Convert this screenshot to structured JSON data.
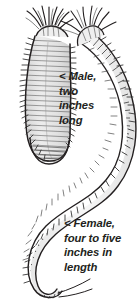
{
  "figure": {
    "background_color": "#ffffff",
    "ink_color": "#231f20",
    "shading_color": "#9a9a9a",
    "annotations": [
      {
        "id": "male",
        "marker": "<",
        "text": "< Male,\ntwo\ninches\nlong",
        "lines": [
          "< Male,",
          "two",
          "inches",
          "long"
        ],
        "points_to": "left worm"
      },
      {
        "id": "female",
        "marker": "<",
        "text": "< Female,\nfour to five\ninches in\nlength",
        "lines": [
          "< Female,",
          "four to five",
          "inches in",
          "length"
        ],
        "points_to": "right worm"
      }
    ],
    "specimens": [
      {
        "name": "male-worm",
        "label": "Male, two inches long",
        "sex": "male",
        "length": "two inches",
        "position": "upper left, J-shaped curve"
      },
      {
        "name": "female-worm",
        "label": "Female, four to five inches in length",
        "sex": "female",
        "length": "four to five inches",
        "position": "right, long S-shaped curve extending to bottom left"
      }
    ]
  }
}
